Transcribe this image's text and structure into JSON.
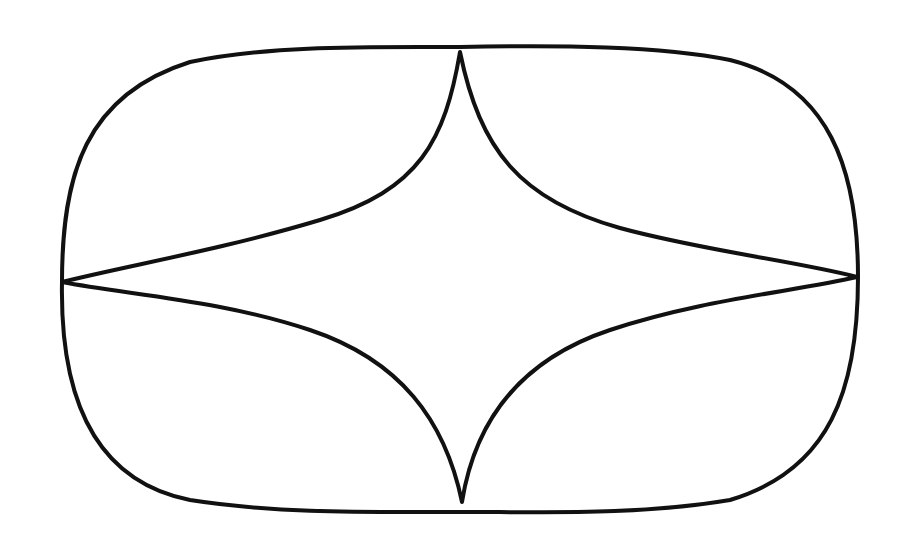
{
  "diagram": {
    "stroke_color": "#111111",
    "background": "#ffffff",
    "cusps": {
      "top": [
        460,
        52
      ],
      "bottom": [
        462,
        502
      ],
      "left": [
        62,
        282
      ],
      "right": [
        857,
        277
      ]
    },
    "outer_shape": "rounded oval",
    "inner_shape": "four-pointed concave star"
  }
}
